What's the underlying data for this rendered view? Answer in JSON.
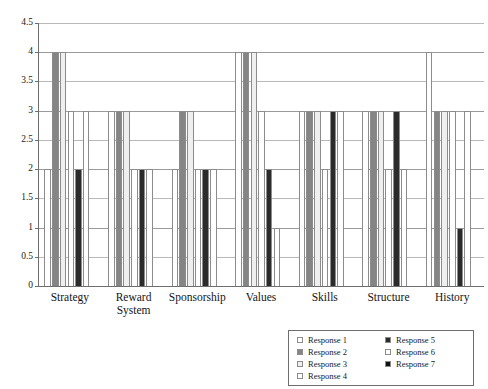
{
  "chart_data": {
    "type": "bar",
    "title": "",
    "subtitle": "",
    "xlabel": "",
    "ylabel": "",
    "ylim": [
      0,
      4.5
    ],
    "y_ticks": [
      "0",
      "0.5",
      "1",
      "1.5",
      "2",
      "2.5",
      "3",
      "3.5",
      "4",
      "4.5"
    ],
    "y_tick_values": [
      0,
      0.5,
      1,
      1.5,
      2,
      2.5,
      3,
      3.5,
      4,
      4.5
    ],
    "grid": true,
    "legend_position": "bottom-right",
    "categories": [
      "Strategy",
      "Reward\nSystem",
      "Sponsorship",
      "Values",
      "Skills",
      "Structure",
      "History"
    ],
    "series": [
      {
        "name": "Response 1",
        "color": "#ffffff",
        "values": [
          2,
          3,
          2,
          4,
          3,
          3,
          4
        ]
      },
      {
        "name": "Response 2",
        "color": "#858585",
        "values": [
          4,
          3,
          3,
          4,
          3,
          3,
          3
        ]
      },
      {
        "name": "Response 3",
        "color": "#efefef",
        "values": [
          4,
          3,
          3,
          4,
          3,
          3,
          3
        ]
      },
      {
        "name": "Response 4",
        "color": "#ffffff",
        "values": [
          3,
          2,
          2,
          3,
          2,
          2,
          3
        ]
      },
      {
        "name": "Response 5",
        "color": "#2b2b2b",
        "values": [
          2,
          2,
          2,
          2,
          3,
          3,
          1
        ]
      },
      {
        "name": "Response 6",
        "color": "#ffffff",
        "values": [
          3,
          2,
          2,
          1,
          3,
          2,
          3
        ]
      },
      {
        "name": "Response 7",
        "color": "#111111",
        "values": [
          0,
          0,
          0,
          0,
          0,
          0,
          0
        ]
      }
    ]
  },
  "legend": {
    "columns": [
      [
        "Response 1",
        "Response 2",
        "Response 3",
        "Response 4"
      ],
      [
        "Response 5",
        "Response 6",
        "Response 7"
      ]
    ]
  }
}
